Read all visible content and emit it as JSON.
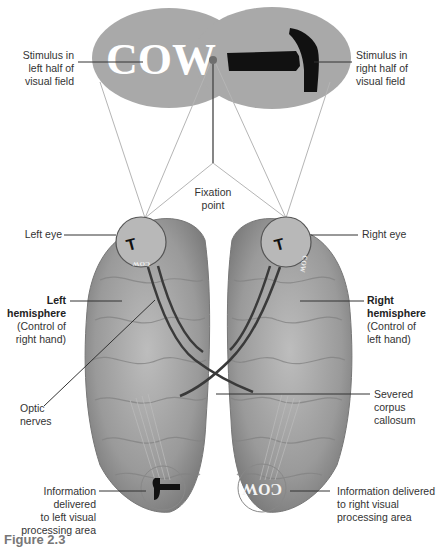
{
  "figure": {
    "stimuli": {
      "left_word": "COW",
      "right_object": "hammer",
      "left_label": [
        "Stimulus in",
        "left half of",
        "visual field"
      ],
      "right_label": [
        "Stimulus in",
        "right half of",
        "visual field"
      ]
    },
    "fixation": {
      "label": [
        "Fixation",
        "point"
      ]
    },
    "eyes": {
      "left": "Left eye",
      "right": "Right eye"
    },
    "hemispheres": {
      "left": {
        "title": "Left",
        "title2": "hemisphere",
        "desc": [
          "(Control of",
          "right hand)"
        ]
      },
      "right": {
        "title": "Right",
        "title2": "hemisphere",
        "desc": [
          "(Control of",
          "left hand)"
        ]
      }
    },
    "optic_nerves": [
      "Optic",
      "nerves"
    ],
    "corpus_callosum": [
      "Severed",
      "corpus",
      "callosum"
    ],
    "left_processing": [
      "Information delivered",
      "to left visual",
      "processing area"
    ],
    "right_processing": [
      "Information delivered",
      "to right visual",
      "processing area"
    ],
    "mirrored_word": "COW",
    "caption": "Figure 2.3"
  },
  "colors": {
    "oval": "#a9a9a9",
    "brain": "#9c9c9c",
    "brain_dark": "#6f6f6f",
    "fixation_dot": "#6e6e6e",
    "leader": "#333333",
    "ray": "#b0b0b0"
  }
}
